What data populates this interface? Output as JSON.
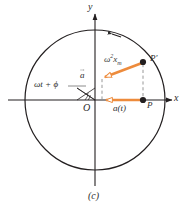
{
  "figure": {
    "caption": "(c)",
    "kind": "uniform-circular-motion-acceleration-phasor"
  },
  "axes": {
    "x_label": "x",
    "y_label": "y",
    "origin_label": "O"
  },
  "points": {
    "p_prime_label": "P′",
    "p_label": "P"
  },
  "labels": {
    "magnitude_base": "ω",
    "magnitude_exponent": "2",
    "magnitude_symbol": "x",
    "magnitude_subscript": "m",
    "acceleration_vector": "a",
    "acceleration_projection": "a(t)",
    "phase_angle": "ωt + ϕ"
  },
  "colors": {
    "accent_orange": "#ED8B3C",
    "stroke_black": "#231f20",
    "dashed_gray": "#8d8d8d",
    "text": "#2b2b2b",
    "background": "#ffffff"
  },
  "geometry": {
    "circle_center_x": 95,
    "circle_center_y": 100,
    "circle_radius": 70,
    "p_prime_x": 143,
    "p_prime_y": 62,
    "p_x": 143,
    "p_y": 100,
    "vector_tip_x": 103,
    "vector_tip_y": 78,
    "projection_tip_x": 101,
    "projection_tip_y": 100
  }
}
